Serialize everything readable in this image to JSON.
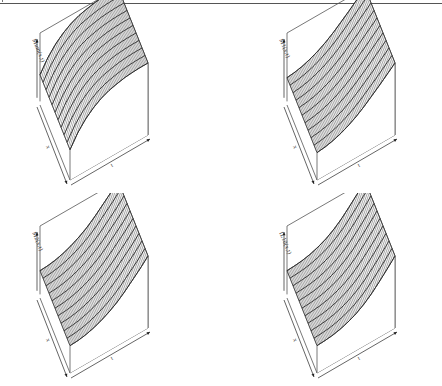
{
  "figure": {
    "layout": "2x2 grid of 3D perspective surface plots",
    "frame_color": "#555555",
    "line_color": "#333333",
    "surface_fill": "#ffffff"
  },
  "chart_data": [
    {
      "type": "surface",
      "title": "",
      "xlabel": "x",
      "ylabel": "t",
      "zlabel": "Mum(x,t)",
      "shape": "concave",
      "description": "Surface rises concavely along t from low front edge to plateau at back; roughly constant along x",
      "profile_along_t": [
        0.0,
        0.3,
        0.52,
        0.68,
        0.8,
        0.88,
        0.93,
        0.97,
        0.99,
        1.0,
        1.0
      ],
      "grid_lines_x": 60,
      "grid_lines_t": 11
    },
    {
      "type": "surface",
      "title": "",
      "xlabel": "x",
      "ylabel": "t",
      "zlabel": "M1(x,t)",
      "shape": "convex",
      "description": "Surface rises convexly along t, nearly flat at start then steeply increasing; roughly constant along x",
      "profile_along_t": [
        0.0,
        0.02,
        0.06,
        0.12,
        0.2,
        0.3,
        0.42,
        0.56,
        0.7,
        0.85,
        1.0
      ],
      "grid_lines_x": 60,
      "grid_lines_t": 11
    },
    {
      "type": "surface",
      "title": "",
      "xlabel": "x",
      "ylabel": "t",
      "zlabel": "M2(x,t)",
      "shape": "convex",
      "description": "Surface rises convexly along t, steeper growth at late t; roughly constant along x",
      "profile_along_t": [
        0.0,
        0.01,
        0.04,
        0.09,
        0.16,
        0.25,
        0.36,
        0.5,
        0.66,
        0.82,
        1.0
      ],
      "grid_lines_x": 60,
      "grid_lines_t": 11
    },
    {
      "type": "surface",
      "title": "",
      "xlabel": "x",
      "ylabel": "t",
      "zlabel": "IL10(x,t)",
      "shape": "convex",
      "description": "Surface rises convexly along t, strongest acceleration at late t; roughly constant along x",
      "profile_along_t": [
        0.0,
        0.01,
        0.03,
        0.07,
        0.13,
        0.21,
        0.32,
        0.46,
        0.63,
        0.81,
        1.0
      ],
      "grid_lines_x": 60,
      "grid_lines_t": 11
    }
  ],
  "panels": [
    {
      "zlabel": "Mum(x,t)",
      "xlabel": "x",
      "tlabel": "t"
    },
    {
      "zlabel": "M1(x,t)",
      "xlabel": "x",
      "tlabel": "t"
    },
    {
      "zlabel": "M2(x,t)",
      "xlabel": "x",
      "tlabel": "t"
    },
    {
      "zlabel": "IL10(x,t)",
      "xlabel": "x",
      "tlabel": "t"
    }
  ]
}
